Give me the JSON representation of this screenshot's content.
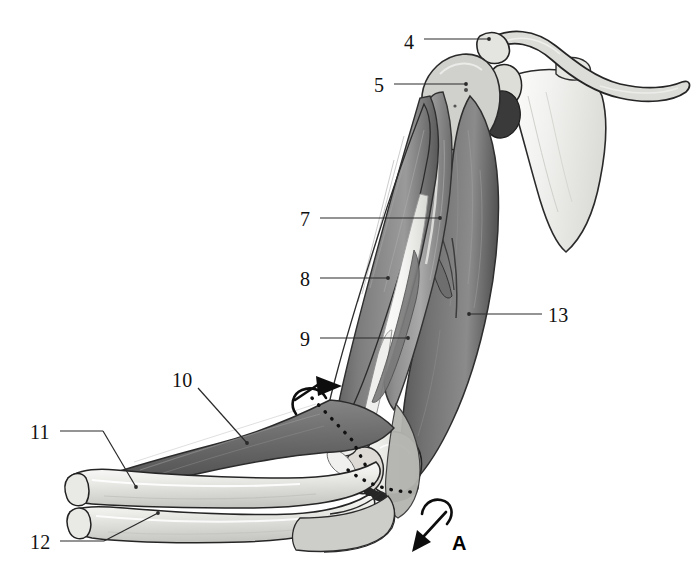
{
  "figure": {
    "background_color": "#ffffff",
    "line_color": "#1a1a1a",
    "bone_fill": "#e8e8e6",
    "muscle_light": "#b9b9b9",
    "muscle_mid": "#8d8d8d",
    "muscle_dark": "#5f5f5f",
    "tendon_fill": "#f2f2f0"
  },
  "labels": [
    {
      "id": "4",
      "text": "4",
      "x": 404,
      "y": 32,
      "leader": "horizontal"
    },
    {
      "id": "5",
      "text": "5",
      "x": 374,
      "y": 75,
      "leader": "horizontal"
    },
    {
      "id": "7",
      "text": "7",
      "x": 300,
      "y": 210,
      "leader": "horizontal"
    },
    {
      "id": "8",
      "text": "8",
      "x": 300,
      "y": 270,
      "leader": "horizontal"
    },
    {
      "id": "9",
      "text": "9",
      "x": 300,
      "y": 330,
      "leader": "horizontal"
    },
    {
      "id": "10",
      "text": "10",
      "x": 172,
      "y": 370,
      "leader": "diagonal"
    },
    {
      "id": "11",
      "text": "11",
      "x": 30,
      "y": 422,
      "leader": "horizontal"
    },
    {
      "id": "12",
      "text": "12",
      "x": 30,
      "y": 532,
      "leader": "diagonal"
    },
    {
      "id": "13",
      "text": "13",
      "x": 548,
      "y": 305,
      "leader": "horizontal"
    }
  ],
  "markers": [
    {
      "id": "A",
      "text": "A",
      "x": 452,
      "y": 533,
      "kind": "rotation-axis-marker"
    }
  ],
  "structures": [
    {
      "name": "clavicle",
      "kind": "bone"
    },
    {
      "name": "scapula",
      "kind": "bone"
    },
    {
      "name": "acromion",
      "kind": "bone"
    },
    {
      "name": "humeral-head",
      "kind": "bone"
    },
    {
      "name": "humerus-shaft",
      "kind": "bone"
    },
    {
      "name": "radius",
      "kind": "bone"
    },
    {
      "name": "ulna",
      "kind": "bone"
    },
    {
      "name": "biceps-brachii",
      "kind": "muscle"
    },
    {
      "name": "brachialis",
      "kind": "muscle"
    },
    {
      "name": "triceps-brachii",
      "kind": "muscle"
    },
    {
      "name": "brachioradialis",
      "kind": "muscle"
    },
    {
      "name": "distal-tendon",
      "kind": "tendon"
    }
  ],
  "axes": [
    {
      "name": "forearm-rotation-axis",
      "style": "dotted"
    },
    {
      "name": "elbow-flexion-axis",
      "style": "dotted"
    }
  ],
  "arrows": [
    {
      "name": "pronation-supination-arrow",
      "direction": "up-right"
    },
    {
      "name": "elbow-flexion-arrow",
      "direction": "down-left"
    }
  ]
}
